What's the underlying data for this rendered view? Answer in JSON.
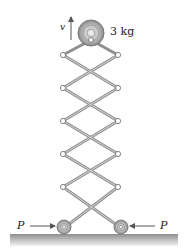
{
  "figure": {
    "corner_label": "",
    "mass_label": "3 kg",
    "velocity_label": "v",
    "force_left_label": "P",
    "force_right_label": "P"
  },
  "colors": {
    "link": "#8f8f8f",
    "joint_fill": "#ffffff",
    "joint_stroke": "#777777",
    "ground_top": "#9a9a9a",
    "ground_bottom": "#e8e8e8",
    "text": "#222222"
  }
}
